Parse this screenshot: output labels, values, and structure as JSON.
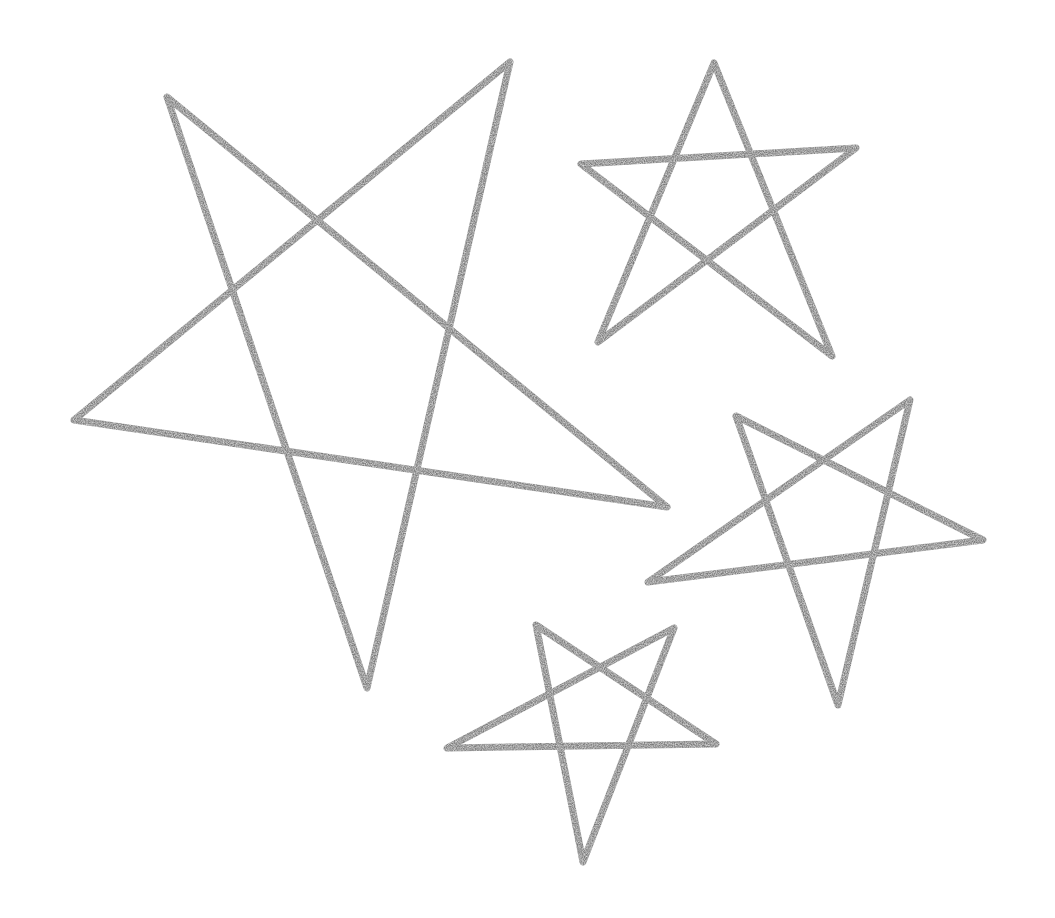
{
  "canvas": {
    "width": 1055,
    "height": 918,
    "background": "#ffffff"
  },
  "style": {
    "stroke_color": "#7a7a7a",
    "stroke_color_dark": "#6a6a6a",
    "stroke_width": 7
  },
  "stars": [
    {
      "name": "large-star",
      "points": [
        [
          167,
          97
        ],
        [
          407,
          470
        ],
        [
          510,
          62
        ],
        [
          367,
          688
        ],
        [
          320,
          222
        ],
        [
          74,
          420
        ],
        [
          667,
          507
        ],
        [
          167,
          97
        ]
      ],
      "path_order": "top-left -> right -> left -> top-right -> bottom -> top-left",
      "vertices": {
        "top_left": [
          167,
          97
        ],
        "top_right": [
          510,
          62
        ],
        "right": [
          667,
          507
        ],
        "bottom": [
          367,
          688
        ],
        "left": [
          74,
          420
        ]
      }
    },
    {
      "name": "top-right-star",
      "vertices": {
        "top": [
          714,
          63
        ],
        "right": [
          856,
          148
        ],
        "lower_right": [
          832,
          356
        ],
        "lower_left": [
          598,
          342
        ],
        "left": [
          581,
          164
        ]
      }
    },
    {
      "name": "middle-right-star",
      "vertices": {
        "top_left": [
          736,
          416
        ],
        "top_right": [
          910,
          400
        ],
        "right": [
          983,
          540
        ],
        "bottom": [
          838,
          705
        ],
        "left": [
          648,
          582
        ]
      }
    },
    {
      "name": "bottom-star",
      "vertices": {
        "top_left": [
          536,
          625
        ],
        "top_right": [
          674,
          628
        ],
        "right": [
          716,
          744
        ],
        "bottom": [
          583,
          862
        ],
        "left": [
          447,
          748
        ]
      }
    }
  ]
}
